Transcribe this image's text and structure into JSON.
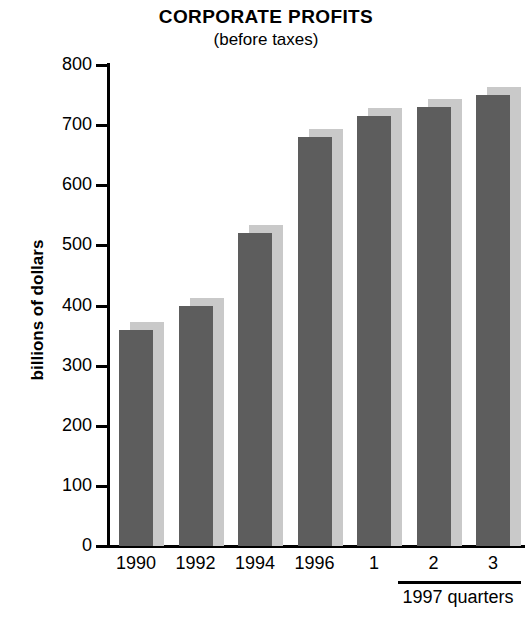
{
  "chart_data": {
    "type": "bar",
    "title": "CORPORATE PROFITS",
    "subtitle": "(before taxes)",
    "xlabel": "",
    "ylabel": "billions of dollars",
    "categories": [
      "1990",
      "1992",
      "1994",
      "1996",
      "1",
      "2",
      "3"
    ],
    "values": [
      360,
      400,
      520,
      680,
      715,
      730,
      750
    ],
    "ylim": [
      0,
      800
    ],
    "y_ticks": [
      800,
      700,
      600,
      500,
      400,
      300,
      200,
      100,
      0
    ],
    "y_tick_labels": [
      "800",
      "700",
      "600",
      "500",
      "400",
      "300",
      "200",
      "100",
      "0"
    ],
    "grid": false,
    "legend": false,
    "group_annotation": "1997 quarters",
    "group_annotation_categories": [
      "1",
      "2",
      "3"
    ],
    "series": [
      {
        "name": "Corporate profits before taxes",
        "values": [
          360,
          400,
          520,
          680,
          715,
          730,
          750
        ]
      }
    ],
    "colors": {
      "bar_front": "#5d5d5d",
      "bar_shadow": "#c9c9c9",
      "axis": "#000000",
      "background": "#ffffff"
    }
  }
}
